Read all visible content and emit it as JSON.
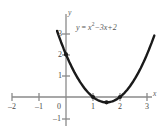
{
  "chart_data": {
    "type": "line",
    "title": "",
    "equation_text": "y = x²−3x+2",
    "equation_parts": {
      "lhs": "y",
      "equals": "=",
      "base": "x",
      "exponent": "2",
      "rest": "−3x+2"
    },
    "xlabel": "x",
    "ylabel": "y",
    "xlim": [
      -2.4,
      3.35
    ],
    "ylim": [
      -1.3,
      3.25
    ],
    "x_ticks": [
      -2,
      -1,
      0,
      1,
      2,
      3
    ],
    "x_tick_labels": [
      "–2",
      "–1",
      "0",
      "1",
      "2",
      "3"
    ],
    "y_ticks": [
      -1,
      1,
      2,
      3
    ],
    "y_tick_labels": [
      "–1",
      "1",
      "2",
      "3"
    ],
    "grid": false,
    "legend": "none",
    "series": [
      {
        "name": "y = x^2 - 3x + 2",
        "color": "#1a1a1a",
        "x": [
          -0.3,
          -0.15,
          0.0,
          0.2,
          0.4,
          0.6,
          0.8,
          1.0,
          1.2,
          1.4,
          1.5,
          1.6,
          1.8,
          2.0,
          2.2,
          2.4,
          2.6,
          2.8,
          3.0,
          3.2,
          3.3
        ],
        "y": [
          2.99,
          2.47,
          2.0,
          1.44,
          0.96,
          0.56,
          0.24,
          0.0,
          -0.16,
          -0.24,
          -0.25,
          -0.24,
          -0.16,
          0.0,
          0.24,
          0.56,
          0.96,
          1.44,
          2.0,
          2.64,
          2.99
        ]
      }
    ],
    "marked_points": [
      {
        "label": "y-intercept",
        "x": 0,
        "y": 2
      },
      {
        "label": "root-1",
        "x": 1,
        "y": 0
      },
      {
        "label": "vertex",
        "x": 1.5,
        "y": -0.25
      },
      {
        "label": "root-2",
        "x": 2,
        "y": 0
      }
    ],
    "axis_color": "#8a8a8a",
    "curve_color": "#1a1a1a",
    "label_color": "#4a4a4a",
    "background": "#ffffff"
  }
}
